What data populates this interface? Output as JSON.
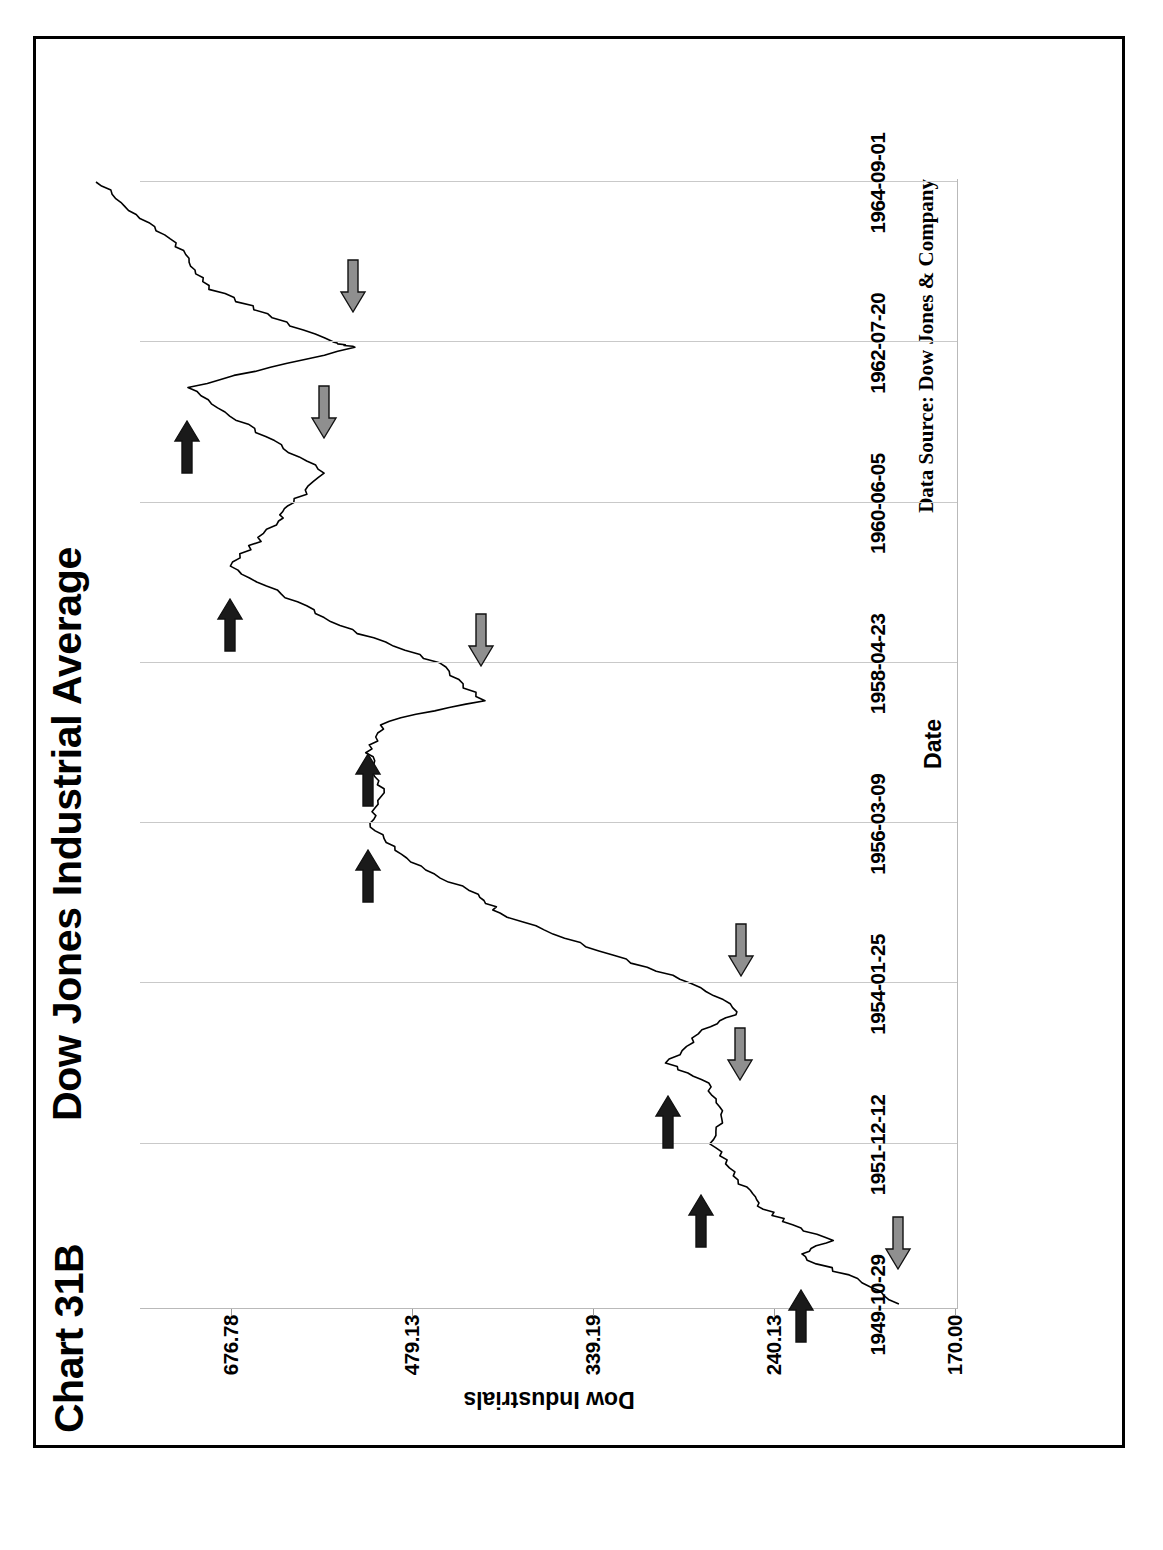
{
  "figure": {
    "chart_number": "Chart 31B",
    "title": "Dow Jones Industrial Average",
    "data_source": "Data Source:  Dow Jones & Company"
  },
  "chart_data": {
    "type": "line",
    "title": "Dow Jones Industrial Average",
    "xlabel": "Date",
    "ylabel": "Dow Industrials",
    "grid": true,
    "legend": "none",
    "orientation": "rotated-90-counterclockwise",
    "yscale": "log",
    "ylim": [
      170.0,
      800.0
    ],
    "ytick_labels": [
      "170.00",
      "240.13",
      "339.19",
      "479.13",
      "676.78"
    ],
    "ytick_values": [
      170.0,
      240.13,
      339.19,
      479.13,
      676.78
    ],
    "xtick_labels": [
      "1949-10-29",
      "1951-12-12",
      "1954-01-25",
      "1956-03-09",
      "1958-04-23",
      "1960-06-05",
      "1962-07-20",
      "1964-09-01"
    ],
    "x": [
      "1949-10-29",
      "1950-03-01",
      "1950-06-15",
      "1950-09-01",
      "1950-12-01",
      "1951-03-01",
      "1951-06-01",
      "1951-12-12",
      "1952-05-01",
      "1952-10-01",
      "1953-01-05",
      "1953-06-15",
      "1953-09-10",
      "1954-01-25",
      "1954-07-01",
      "1954-12-31",
      "1955-04-01",
      "1955-09-23",
      "1956-03-09",
      "1956-07-15",
      "1957-02-12",
      "1957-07-15",
      "1957-10-22",
      "1958-04-23",
      "1958-10-01",
      "1959-08-03",
      "1960-03-08",
      "1960-06-05",
      "1960-10-25",
      "1961-12-13",
      "1962-06-26",
      "1962-07-20",
      "1963-04-01",
      "1963-12-01",
      "1964-09-01"
    ],
    "values": [
      189.5,
      206.0,
      228.0,
      216.0,
      235.0,
      248.0,
      255.0,
      270.0,
      265.0,
      272.0,
      293.8,
      275.0,
      255.5,
      280.0,
      335.0,
      404.4,
      425.0,
      487.5,
      521.0,
      505.0,
      520.8,
      503.0,
      419.8,
      455.0,
      540.0,
      678.1,
      617.0,
      600.0,
      566.0,
      734.9,
      535.8,
      560.0,
      700.0,
      760.0,
      875.0
    ],
    "series_label": "Dow Industrials",
    "annotations": {
      "peak_marker": {
        "name": "dark-right-arrow",
        "color": "#1a1a1a",
        "direction": "right",
        "meaning": "major peak",
        "count": 7
      },
      "trough_marker": {
        "name": "gray-left-arrow",
        "color": "#8f8f8f",
        "direction": "left",
        "meaning": "major trough",
        "count": 6
      },
      "peaks": [
        {
          "label": "1951-09",
          "value": 276.0
        },
        {
          "label": "1953-01-05",
          "value": 293.8
        },
        {
          "label": "1956-04-06",
          "value": 521.0
        },
        {
          "label": "1957-07-15",
          "value": 520.8
        },
        {
          "label": "1959-08-03",
          "value": 678.1
        },
        {
          "label": "1961-12-13",
          "value": 734.9
        },
        {
          "label": "1950-06-12",
          "value": 228.0
        }
      ],
      "troughs": [
        {
          "label": "1949-10-29",
          "value": 189.5
        },
        {
          "label": "1952-05-01",
          "value": 256.0
        },
        {
          "label": "1953-09-14",
          "value": 255.5
        },
        {
          "label": "1957-10-22",
          "value": 419.8
        },
        {
          "label": "1960-10-25",
          "value": 566.0
        },
        {
          "label": "1962-06-26",
          "value": 535.8
        }
      ]
    }
  }
}
